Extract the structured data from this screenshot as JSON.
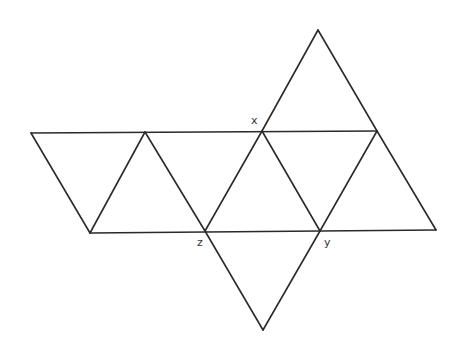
{
  "diagram": {
    "type": "octahedron-net",
    "colors": {
      "stroke": "#2a2a2a",
      "label": "#333333",
      "background": "#ffffff"
    },
    "vertices": {
      "A": [
        31,
        133
      ],
      "B": [
        145,
        132
      ],
      "X": [
        262,
        131
      ],
      "R": [
        377,
        131
      ],
      "T": [
        318,
        30
      ],
      "C": [
        90,
        233
      ],
      "Z": [
        205,
        231
      ],
      "Y": [
        320,
        231
      ],
      "D": [
        436,
        230
      ],
      "E": [
        263,
        330
      ]
    },
    "labels": [
      {
        "id": "x",
        "text": "x",
        "x": 251,
        "y": 124
      },
      {
        "id": "z",
        "text": "z",
        "x": 197,
        "y": 246
      },
      {
        "id": "y",
        "text": "y",
        "x": 324,
        "y": 246
      }
    ]
  }
}
